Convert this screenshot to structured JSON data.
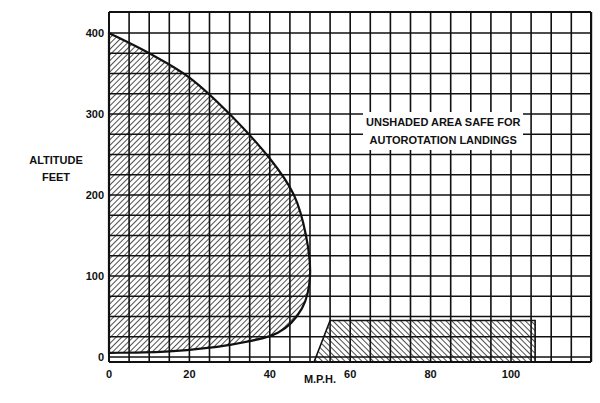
{
  "chart_data": {
    "type": "area",
    "title": "",
    "xlabel": "M.P.H.",
    "ylabel": "ALTITUDE FEET",
    "ylabel_lines": [
      "ALTITUDE",
      "FEET"
    ],
    "xlim": [
      0,
      120
    ],
    "ylim": [
      0,
      425
    ],
    "x_ticks": [
      0,
      20,
      40,
      60,
      80,
      100
    ],
    "y_ticks": [
      0,
      100,
      200,
      300,
      400
    ],
    "grid": true,
    "grid_spacing": {
      "x": 5,
      "y": 25
    },
    "annotation": "UNSHADED AREA SAFE FOR AUTOROTATION LANDINGS",
    "annotation_lines": [
      "UNSHADED AREA SAFE FOR",
      "AUTOROTATION LANDINGS"
    ],
    "series": [
      {
        "name": "Avoid region (low speed / height-velocity curve)",
        "hatch": "forward-diagonal",
        "boundary": [
          {
            "mph": 0,
            "ft": 400
          },
          {
            "mph": 10,
            "ft": 375
          },
          {
            "mph": 20,
            "ft": 345
          },
          {
            "mph": 30,
            "ft": 300
          },
          {
            "mph": 40,
            "ft": 245
          },
          {
            "mph": 46,
            "ft": 200
          },
          {
            "mph": 49,
            "ft": 150
          },
          {
            "mph": 50,
            "ft": 100
          },
          {
            "mph": 48,
            "ft": 60
          },
          {
            "mph": 42,
            "ft": 30
          },
          {
            "mph": 30,
            "ft": 15
          },
          {
            "mph": 15,
            "ft": 7
          },
          {
            "mph": 0,
            "ft": 5
          }
        ]
      },
      {
        "name": "Avoid region (high speed / low altitude)",
        "hatch": "back-diagonal",
        "boundary": [
          {
            "mph": 51,
            "ft": 0
          },
          {
            "mph": 55,
            "ft": 45
          },
          {
            "mph": 106,
            "ft": 45
          },
          {
            "mph": 106,
            "ft": 0
          }
        ]
      }
    ]
  }
}
